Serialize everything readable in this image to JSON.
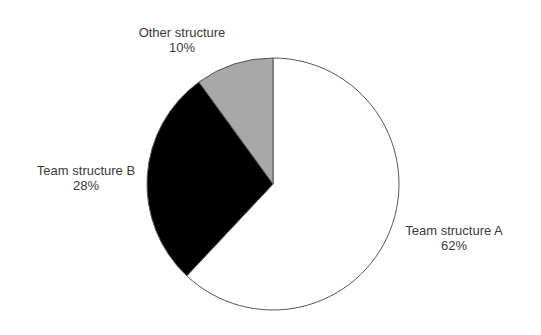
{
  "chart_data": {
    "type": "pie",
    "title": "",
    "start_angle_deg": 0,
    "direction": "clockwise",
    "slices": [
      {
        "label": "Team structure A",
        "value": 62,
        "value_label": "62%",
        "color": "#ffffff"
      },
      {
        "label": "Team structure B",
        "value": 28,
        "value_label": "28%",
        "color": "#000000"
      },
      {
        "label": "Other structure",
        "value": 10,
        "value_label": "10%",
        "color": "#a8a8a8"
      }
    ],
    "legend": "none",
    "labels_position": "outside"
  },
  "labels": {
    "a": {
      "name": "Team structure A",
      "pct": "62%"
    },
    "b": {
      "name": "Team structure B",
      "pct": "28%"
    },
    "other": {
      "name": "Other structure",
      "pct": "10%"
    }
  },
  "style": {
    "outline": "#555555",
    "center": [
      273,
      184
    ],
    "radius": 126
  }
}
